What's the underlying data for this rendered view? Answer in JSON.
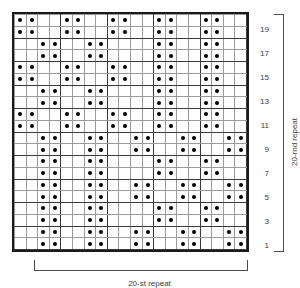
{
  "chart_data": {
    "type": "heatmap",
    "title": "",
    "subtitle": "",
    "xlabel": "20-st repeat",
    "ylabel": "20-rnd repeat",
    "grid": true,
    "legend": "none",
    "columns": 20,
    "rows": 20,
    "column_labels": [
      "1",
      "2",
      "3",
      "4",
      "5",
      "6",
      "7",
      "8",
      "9",
      "10",
      "11",
      "12",
      "13",
      "14",
      "15",
      "16",
      "17",
      "18",
      "19",
      "20"
    ],
    "row_labels_visible": [
      "19",
      "17",
      "15",
      "13",
      "11",
      "9",
      "7",
      "5",
      "3",
      "1"
    ],
    "cell_symbol": "dot",
    "cell_symbol_meaning": "purl stitch",
    "cell_color": "#000000",
    "grid_line_color": "#9a9a9a",
    "border_color": "#1a1a1a",
    "label_color": "#3c3c3c",
    "note": "values[r] lists the 1-based column indices that contain a dot, ordered from row 20 (top) down to row 1 (bottom)",
    "row_order_top_to_bottom": [
      20,
      19,
      18,
      17,
      16,
      15,
      14,
      13,
      12,
      11,
      10,
      9,
      8,
      7,
      6,
      5,
      4,
      3,
      2,
      1
    ],
    "values": [
      [
        1,
        2,
        5,
        6,
        9,
        10,
        13,
        14,
        17,
        18
      ],
      [
        1,
        2,
        5,
        6,
        9,
        10,
        13,
        14,
        17,
        18
      ],
      [
        3,
        4,
        7,
        8,
        13,
        14,
        17,
        18
      ],
      [
        3,
        4,
        7,
        8,
        13,
        14,
        17,
        18
      ],
      [
        1,
        2,
        5,
        6,
        9,
        10,
        13,
        14,
        17,
        18
      ],
      [
        1,
        2,
        5,
        6,
        9,
        10,
        13,
        14,
        17,
        18
      ],
      [
        3,
        4,
        7,
        8,
        13,
        14,
        17,
        18
      ],
      [
        3,
        4,
        7,
        8,
        13,
        14,
        17,
        18
      ],
      [
        1,
        2,
        5,
        6,
        9,
        10,
        13,
        14,
        17,
        18
      ],
      [
        1,
        2,
        5,
        6,
        9,
        10,
        13,
        14,
        17,
        18
      ],
      [
        3,
        4,
        7,
        8,
        11,
        12,
        15,
        16,
        19,
        20
      ],
      [
        3,
        4,
        7,
        8,
        11,
        12,
        15,
        16,
        19,
        20
      ],
      [
        3,
        4,
        7,
        8,
        13,
        14,
        17,
        18
      ],
      [
        3,
        4,
        7,
        8,
        13,
        14,
        17,
        18
      ],
      [
        3,
        4,
        7,
        8,
        11,
        12,
        15,
        16,
        19,
        20
      ],
      [
        3,
        4,
        7,
        8,
        11,
        12,
        15,
        16,
        19,
        20
      ],
      [
        3,
        4,
        7,
        8,
        13,
        14,
        17,
        18
      ],
      [
        3,
        4,
        7,
        8,
        13,
        14,
        17,
        18
      ],
      [
        3,
        4,
        7,
        8,
        11,
        12,
        15,
        16,
        19,
        20
      ],
      [
        3,
        4,
        7,
        8,
        11,
        12,
        15,
        16,
        19,
        20
      ]
    ]
  },
  "labels": {
    "stitch_repeat": "20-st repeat",
    "round_repeat": "20-rnd repeat"
  },
  "row_numbers": [
    {
      "label": "19",
      "row": 19
    },
    {
      "label": "17",
      "row": 17
    },
    {
      "label": "15",
      "row": 15
    },
    {
      "label": "13",
      "row": 13
    },
    {
      "label": "11",
      "row": 11
    },
    {
      "label": "9",
      "row": 9
    },
    {
      "label": "7",
      "row": 7
    },
    {
      "label": "5",
      "row": 5
    },
    {
      "label": "3",
      "row": 3
    },
    {
      "label": "1",
      "row": 1
    }
  ]
}
